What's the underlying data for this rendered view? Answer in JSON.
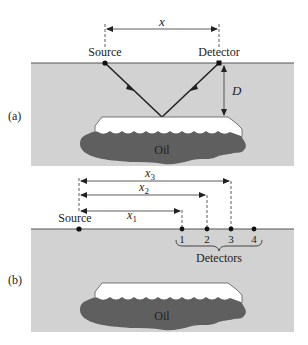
{
  "colors": {
    "background": "#ffffff",
    "ground": "#d2d2d2",
    "surface_line": "#555555",
    "cap_rock": "#ffffff",
    "oil": "#5f5f5f",
    "ink": "#222222"
  },
  "panel_a": {
    "label": "(a)",
    "source_label": "Source",
    "detector_label": "Detector",
    "distance_label": "x",
    "depth_label": "D",
    "oil_label": "Oil"
  },
  "panel_b": {
    "label": "(b)",
    "source_label": "Source",
    "distance_labels": [
      {
        "base": "x",
        "sub": "1"
      },
      {
        "base": "x",
        "sub": "2"
      },
      {
        "base": "x",
        "sub": "3"
      }
    ],
    "detector_numbers": [
      "1",
      "2",
      "3",
      "4"
    ],
    "detectors_group_label": "Detectors",
    "oil_label": "Oil"
  }
}
